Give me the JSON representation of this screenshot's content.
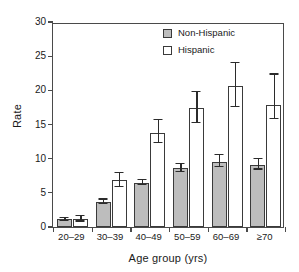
{
  "chart_data": {
    "type": "bar",
    "title": "",
    "xlabel": "Age group (yrs)",
    "ylabel": "Rate",
    "ylim": [
      0,
      30
    ],
    "yticks": [
      0,
      5,
      10,
      15,
      20,
      25,
      30
    ],
    "grid": false,
    "legend_position": "top-right",
    "categories": [
      "20–29",
      "30–39",
      "40–49",
      "50–59",
      "60–69",
      "≥70"
    ],
    "series": [
      {
        "name": "Non-Hispanic",
        "color": "#bdbdbd",
        "values": [
          1.1,
          3.7,
          6.5,
          8.6,
          9.5,
          9.1
        ],
        "err_low": [
          0.9,
          3.4,
          6.1,
          8.0,
          8.8,
          8.4
        ],
        "err_high": [
          1.3,
          4.0,
          6.9,
          9.2,
          10.5,
          9.9
        ]
      },
      {
        "name": "Hispanic",
        "color": "#ffffff",
        "values": [
          1.2,
          6.9,
          13.8,
          17.4,
          20.6,
          17.8
        ],
        "err_low": [
          0.8,
          5.9,
          12.3,
          15.2,
          17.6,
          15.8
        ],
        "err_high": [
          1.6,
          7.9,
          15.6,
          19.7,
          24.0,
          22.3
        ]
      }
    ]
  },
  "legend": {
    "entries": [
      {
        "label": "Non-Hispanic"
      },
      {
        "label": "Hispanic"
      }
    ]
  }
}
